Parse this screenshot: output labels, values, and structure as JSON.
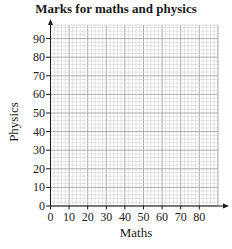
{
  "chart_data": {
    "type": "scatter",
    "title": "Marks for maths and physics",
    "xlabel": "Maths",
    "ylabel": "Physics",
    "x_ticks": [
      0,
      10,
      20,
      30,
      40,
      50,
      60,
      70,
      80
    ],
    "y_ticks": [
      0,
      10,
      20,
      30,
      40,
      50,
      60,
      70,
      80,
      90
    ],
    "xlim": [
      0,
      92
    ],
    "ylim": [
      0,
      98
    ],
    "grid": true,
    "minor_grid_step": 2,
    "major_grid_step": 10,
    "series": [],
    "legend": null
  },
  "colors": {
    "axis": "#1a1a1a",
    "grid_minor": "#c8c8c8",
    "grid_major": "#9a9a9a"
  }
}
